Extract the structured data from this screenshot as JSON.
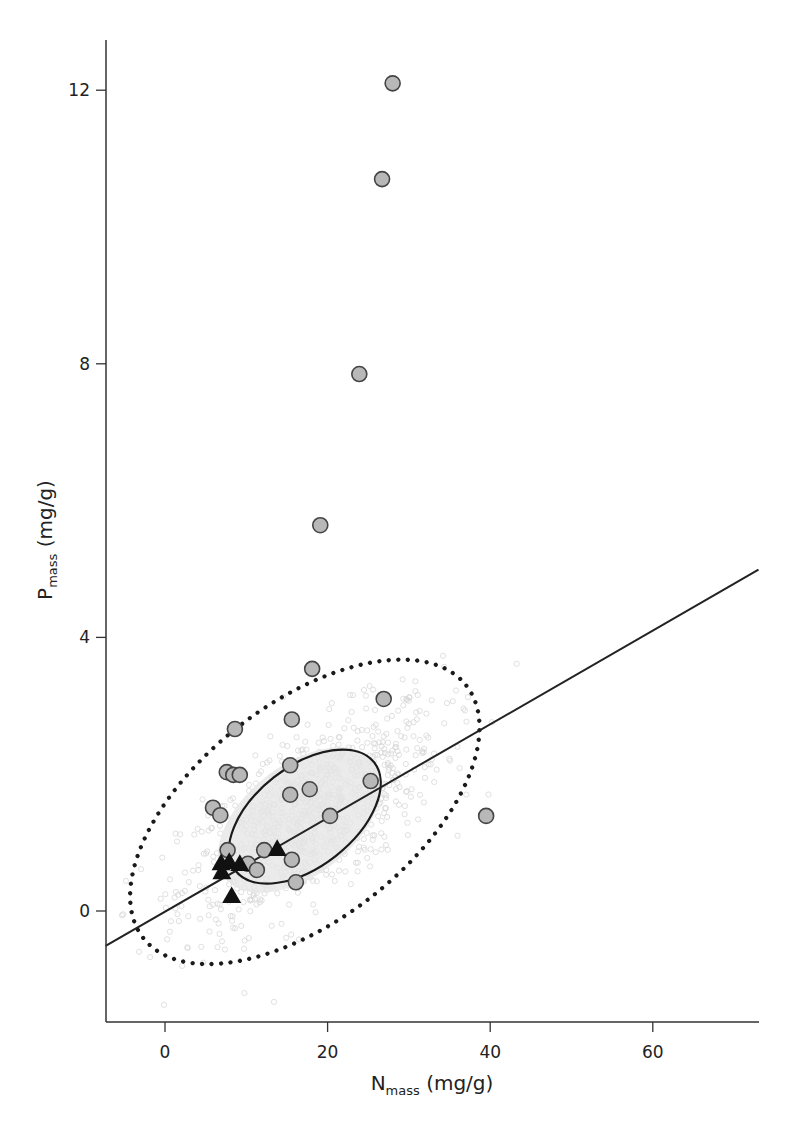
{
  "chart_data": {
    "type": "scatter",
    "title": "",
    "xlabel": "N",
    "xlabel_sub": "mass",
    "xlabel_unit": " (mg/g)",
    "ylabel": "P",
    "ylabel_sub": "mass",
    "ylabel_unit": " (mg/g)",
    "xlim": [
      -7.3,
      73
    ],
    "ylim": [
      -1.6,
      12.8
    ],
    "x_ticks": [
      0,
      20,
      40,
      60
    ],
    "y_ticks": [
      0,
      4,
      8,
      12
    ],
    "grid": false,
    "legend": null,
    "series": [
      {
        "name": "circles",
        "marker": "circle",
        "fill": "#b8b8b8",
        "stroke": "#444444",
        "points": [
          [
            28.0,
            12.1
          ],
          [
            26.7,
            10.7
          ],
          [
            23.9,
            7.85
          ],
          [
            19.1,
            5.64
          ],
          [
            18.1,
            3.54
          ],
          [
            26.9,
            3.1
          ],
          [
            15.6,
            2.8
          ],
          [
            8.6,
            2.66
          ],
          [
            7.6,
            2.03
          ],
          [
            8.4,
            1.99
          ],
          [
            9.2,
            1.99
          ],
          [
            15.4,
            2.13
          ],
          [
            15.4,
            1.7
          ],
          [
            17.8,
            1.78
          ],
          [
            25.3,
            1.9
          ],
          [
            20.3,
            1.39
          ],
          [
            39.5,
            1.39
          ],
          [
            5.9,
            1.51
          ],
          [
            6.8,
            1.4
          ],
          [
            7.7,
            0.89
          ],
          [
            12.2,
            0.89
          ],
          [
            15.6,
            0.75
          ],
          [
            16.1,
            0.42
          ],
          [
            10.2,
            0.69
          ],
          [
            11.3,
            0.6
          ]
        ]
      },
      {
        "name": "triangles",
        "marker": "triangle",
        "fill": "#111111",
        "points": [
          [
            6.9,
            0.7
          ],
          [
            7.9,
            0.72
          ],
          [
            9.2,
            0.69
          ],
          [
            13.8,
            0.91
          ],
          [
            7.0,
            0.57
          ],
          [
            8.2,
            0.22
          ]
        ]
      },
      {
        "name": "background cloud",
        "marker": "small-faint",
        "fill": "#dcdcdc",
        "description": "dense cloud of faint light-grey points, centered ~N 18, P 1.5"
      }
    ],
    "fit_line": {
      "style": "solid",
      "color": "#222222",
      "from": [
        -7.3,
        -0.51
      ],
      "to": [
        73,
        4.99
      ]
    },
    "ellipses": [
      {
        "name": "inner",
        "style": "solid",
        "center": [
          17.2,
          1.38
        ],
        "rx_px": 88,
        "ry_px": 50,
        "rotation_deg": -38
      },
      {
        "name": "outer",
        "style": "dotted",
        "center": [
          17.2,
          1.45
        ],
        "rx_px": 205,
        "ry_px": 108,
        "rotation_deg": -38
      }
    ]
  }
}
